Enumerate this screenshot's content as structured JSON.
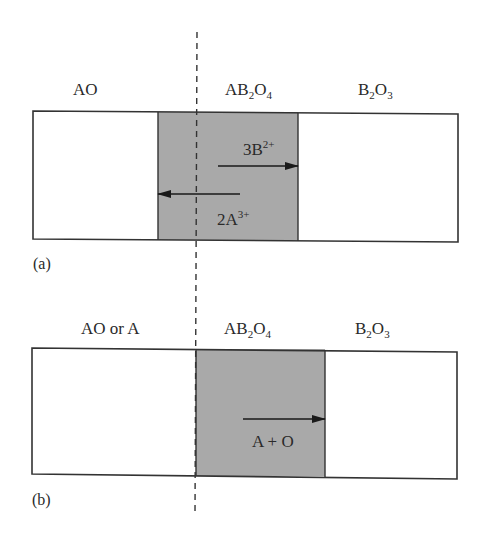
{
  "colors": {
    "line": "#333333",
    "product_fill": "#a9a9a9",
    "reactant_fill": "#ffffff",
    "text": "#2a2a2a"
  },
  "interface_line": {
    "style": "dashed",
    "description": "original interface marker"
  },
  "panels": [
    {
      "tag": "(a)",
      "phases": [
        {
          "id": "left",
          "label_parts": [
            {
              "t": "AO"
            }
          ]
        },
        {
          "id": "middle",
          "label_parts": [
            {
              "t": "AB"
            },
            {
              "sub": "2"
            },
            {
              "t": "O"
            },
            {
              "sub": "4"
            }
          ]
        },
        {
          "id": "right",
          "label_parts": [
            {
              "t": "B"
            },
            {
              "sub": "2"
            },
            {
              "t": "O"
            },
            {
              "sub": "3"
            }
          ]
        }
      ],
      "fluxes": [
        {
          "direction": "right",
          "species_parts": [
            {
              "t": "3B"
            },
            {
              "sup": "2+"
            }
          ]
        },
        {
          "direction": "left",
          "species_parts": [
            {
              "t": "2A"
            },
            {
              "sup": "3+"
            }
          ]
        }
      ]
    },
    {
      "tag": "(b)",
      "phases": [
        {
          "id": "left",
          "label_parts": [
            {
              "t": "AO or A"
            }
          ]
        },
        {
          "id": "middle",
          "label_parts": [
            {
              "t": "AB"
            },
            {
              "sub": "2"
            },
            {
              "t": "O"
            },
            {
              "sub": "4"
            }
          ]
        },
        {
          "id": "right",
          "label_parts": [
            {
              "t": "B"
            },
            {
              "sub": "2"
            },
            {
              "t": "O"
            },
            {
              "sub": "3"
            }
          ]
        }
      ],
      "fluxes": [
        {
          "direction": "right",
          "species_parts": [
            {
              "t": "A + O"
            }
          ]
        }
      ]
    }
  ]
}
